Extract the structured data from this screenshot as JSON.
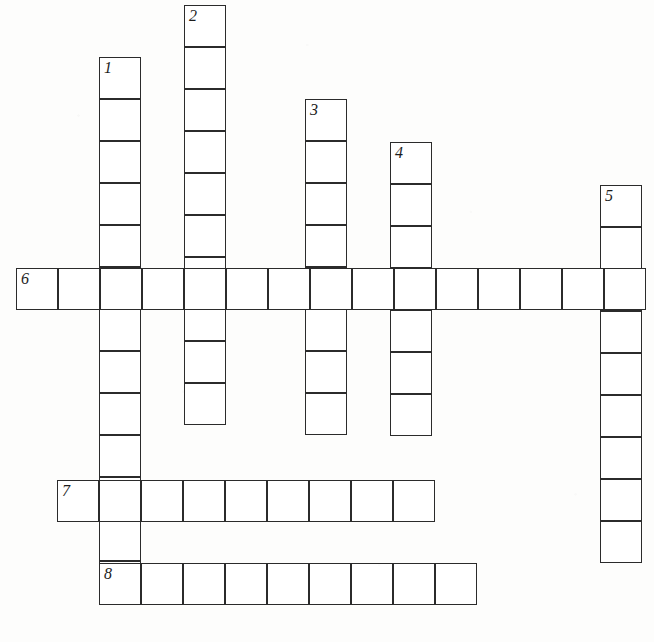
{
  "document": {
    "type": "crossword-puzzle-grid",
    "title": "Crossword Puzzle",
    "background_color": "#fdfdfc",
    "cell_border_color": "#2b2b2b",
    "cell_fill_color": "#ffffff",
    "number_color": "#1c1c1c",
    "cell_size": 42
  },
  "grid": {
    "cell_size": 42,
    "entries": [
      {
        "number": "1",
        "direction": "down",
        "x": 99,
        "y": 57,
        "length": 13,
        "orientation": "vertical"
      },
      {
        "number": "2",
        "direction": "down",
        "x": 184,
        "y": 5,
        "length": 10,
        "orientation": "vertical"
      },
      {
        "number": "3",
        "direction": "down",
        "x": 305,
        "y": 99,
        "length": 8,
        "orientation": "vertical"
      },
      {
        "number": "4",
        "direction": "down",
        "x": 390,
        "y": 142,
        "length": 7,
        "orientation": "vertical"
      },
      {
        "number": "5",
        "direction": "down",
        "x": 600,
        "y": 185,
        "length": 9,
        "orientation": "vertical"
      },
      {
        "number": "6",
        "direction": "across",
        "x": 16,
        "y": 268,
        "length": 15,
        "orientation": "horizontal"
      },
      {
        "number": "7",
        "direction": "across",
        "x": 57,
        "y": 480,
        "length": 9,
        "orientation": "horizontal"
      },
      {
        "number": "8",
        "direction": "across",
        "x": 99,
        "y": 563,
        "length": 9,
        "orientation": "horizontal"
      }
    ],
    "numbers": [
      {
        "label": "1",
        "x": 104,
        "y": 60
      },
      {
        "label": "2",
        "x": 189,
        "y": 8
      },
      {
        "label": "3",
        "x": 310,
        "y": 102
      },
      {
        "label": "4",
        "x": 395,
        "y": 145
      },
      {
        "label": "5",
        "x": 605,
        "y": 188
      },
      {
        "label": "6",
        "x": 21,
        "y": 271
      },
      {
        "label": "7",
        "x": 62,
        "y": 483
      },
      {
        "label": "8",
        "x": 104,
        "y": 566
      }
    ]
  },
  "footer": {
    "text": "",
    "note": "partially cropped line of text at bottom edge"
  }
}
